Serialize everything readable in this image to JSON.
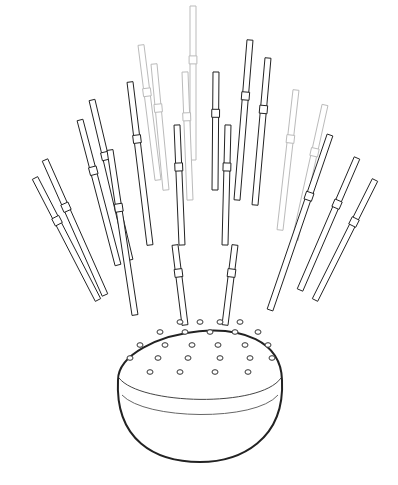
{
  "illustration": {
    "subject": "straw holder sphere with drinking straws",
    "background": "#ffffff",
    "line_color": "#222222",
    "faint_line_color": "#bbbbbb",
    "straws": [
      {
        "x1": 193,
        "y1": 6,
        "x2": 193,
        "y2": 160,
        "faint": true
      },
      {
        "x1": 141,
        "y1": 45,
        "x2": 158,
        "y2": 180,
        "faint": true
      },
      {
        "x1": 154,
        "y1": 64,
        "x2": 166,
        "y2": 190,
        "faint": true
      },
      {
        "x1": 185,
        "y1": 72,
        "x2": 190,
        "y2": 200,
        "faint": true
      },
      {
        "x1": 250,
        "y1": 40,
        "x2": 237,
        "y2": 200,
        "faint": false
      },
      {
        "x1": 268,
        "y1": 58,
        "x2": 255,
        "y2": 205,
        "faint": false
      },
      {
        "x1": 216,
        "y1": 72,
        "x2": 215,
        "y2": 190,
        "faint": false
      },
      {
        "x1": 130,
        "y1": 82,
        "x2": 150,
        "y2": 245,
        "faint": false
      },
      {
        "x1": 296,
        "y1": 90,
        "x2": 280,
        "y2": 230,
        "faint": true
      },
      {
        "x1": 325,
        "y1": 105,
        "x2": 295,
        "y2": 240,
        "faint": true
      },
      {
        "x1": 92,
        "y1": 100,
        "x2": 130,
        "y2": 260,
        "faint": false
      },
      {
        "x1": 80,
        "y1": 120,
        "x2": 118,
        "y2": 265,
        "faint": false
      },
      {
        "x1": 177,
        "y1": 125,
        "x2": 182,
        "y2": 245,
        "faint": false
      },
      {
        "x1": 228,
        "y1": 125,
        "x2": 225,
        "y2": 245,
        "faint": false
      },
      {
        "x1": 45,
        "y1": 160,
        "x2": 105,
        "y2": 295,
        "faint": false
      },
      {
        "x1": 35,
        "y1": 178,
        "x2": 98,
        "y2": 300,
        "faint": false
      },
      {
        "x1": 357,
        "y1": 158,
        "x2": 300,
        "y2": 290,
        "faint": false
      },
      {
        "x1": 375,
        "y1": 180,
        "x2": 315,
        "y2": 300,
        "faint": false
      },
      {
        "x1": 330,
        "y1": 135,
        "x2": 270,
        "y2": 310,
        "faint": false
      },
      {
        "x1": 175,
        "y1": 245,
        "x2": 185,
        "y2": 325,
        "faint": false
      },
      {
        "x1": 235,
        "y1": 245,
        "x2": 225,
        "y2": 325,
        "faint": false
      },
      {
        "x1": 110,
        "y1": 150,
        "x2": 135,
        "y2": 315,
        "faint": false
      }
    ]
  }
}
